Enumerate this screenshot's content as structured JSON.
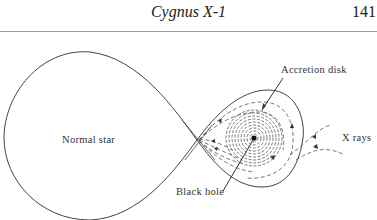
{
  "header": {
    "running_title": "Cygnus X-1",
    "page_number": "141"
  },
  "figure": {
    "labels": {
      "normal_star": "Normal star",
      "accretion_disk": "Accretion disk",
      "x_rays": "X rays",
      "black_hole": "Black hole"
    },
    "colors": {
      "line": "#444444",
      "dash": "#555555"
    }
  }
}
